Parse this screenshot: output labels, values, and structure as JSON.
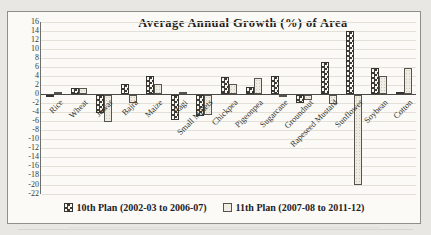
{
  "chart_data": {
    "type": "bar",
    "title": "Average Annual Growth (%) of Area",
    "categories": [
      "Rice",
      "Wheat",
      "Jowar",
      "Bajra",
      "Maize",
      "Ragi",
      "Small Millets",
      "Chickpea",
      "Pigeonpea",
      "Sugarcane",
      "Groundnut",
      "Rapeseed Mustard",
      "Sunflower",
      "Soybean",
      "Cotton"
    ],
    "series": [
      {
        "name": "10th Plan (2002-03 to 2006-07)",
        "values": [
          -0.4,
          1.4,
          -4.0,
          2.3,
          4.0,
          -5.5,
          -4.6,
          3.8,
          1.6,
          4.0,
          -1.7,
          7.0,
          14.0,
          5.7,
          0.4
        ]
      },
      {
        "name": "11th Plan (2007-08 to 2011-12)",
        "values": [
          0.4,
          1.3,
          -6.0,
          -1.8,
          2.2,
          0.5,
          -4.3,
          2.3,
          3.5,
          -0.3,
          -1.0,
          -1.9,
          -19.9,
          3.9,
          5.8
        ]
      }
    ],
    "ylim": [
      -22,
      16
    ],
    "ytick_step": 2,
    "xlabel": "",
    "ylabel": "",
    "grid": true,
    "legend_position": "bottom"
  },
  "legend": {
    "items": [
      {
        "label": "10th Plan (2002-03 to 2006-07)"
      },
      {
        "label": "11th Plan (2007-08 to 2011-12)"
      }
    ]
  },
  "colors": {
    "paper": "#fbfaf6",
    "page_background": "#e8e7e3",
    "frame_border": "#919088",
    "bar_pattern_dark": "#3c3b35",
    "bar_light_fill": "#efece3",
    "gridline": "#e3e0d8",
    "text": "#23221f"
  }
}
